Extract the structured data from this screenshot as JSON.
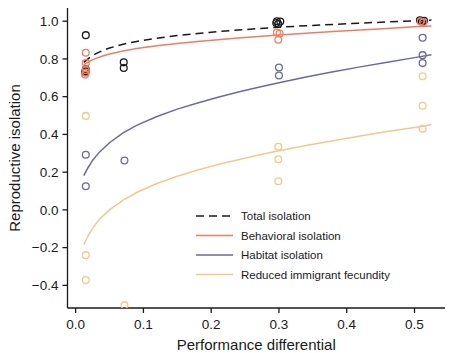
{
  "chart_data": {
    "type": "scatter",
    "title": "",
    "xlabel": "Performance differential",
    "ylabel": "Reproductive isolation",
    "xlim": [
      -0.012,
      0.545
    ],
    "ylim": [
      -0.52,
      1.07
    ],
    "xticks": [
      0.0,
      0.1,
      0.2,
      0.3,
      0.4,
      0.5
    ],
    "xticklabels": [
      "0.0",
      "0.1",
      "0.2",
      "0.3",
      "0.4",
      "0.5"
    ],
    "yticks": [
      1.0,
      0.8,
      0.6,
      0.4,
      0.2,
      0.0,
      -0.2,
      -0.4
    ],
    "yticklabels": [
      "1.0",
      "0.8",
      "0.6",
      "0.4",
      "0.2",
      "0.0",
      "−0.2",
      "−0.4"
    ],
    "grid": false,
    "legend_position": "lower right",
    "colors": {
      "total": "#1a1a1a",
      "behavioral": "#ef7d63",
      "habitat": "#6a6a9e",
      "fecundity": "#f3c98b"
    },
    "series": [
      {
        "name": "Total isolation",
        "key": "total",
        "color": "#1a1a1a",
        "linestyle": "dashed",
        "marker": "open-circle",
        "curve": [
          [
            0.012,
            0.782
          ],
          [
            0.02,
            0.806
          ],
          [
            0.03,
            0.828
          ],
          [
            0.04,
            0.845
          ],
          [
            0.05,
            0.858
          ],
          [
            0.07,
            0.878
          ],
          [
            0.09,
            0.893
          ],
          [
            0.12,
            0.91
          ],
          [
            0.15,
            0.924
          ],
          [
            0.18,
            0.935
          ],
          [
            0.21,
            0.945
          ],
          [
            0.24,
            0.953
          ],
          [
            0.27,
            0.961
          ],
          [
            0.3,
            0.968
          ],
          [
            0.34,
            0.976
          ],
          [
            0.38,
            0.983
          ],
          [
            0.42,
            0.99
          ],
          [
            0.46,
            0.996
          ],
          [
            0.5,
            1.002
          ],
          [
            0.525,
            1.006
          ]
        ],
        "points": [
          [
            0.015,
            0.926
          ],
          [
            0.015,
            0.745
          ],
          [
            0.015,
            0.735
          ],
          [
            0.014,
            0.73
          ],
          [
            0.071,
            0.782
          ],
          [
            0.071,
            0.752
          ],
          [
            0.297,
            1.0
          ],
          [
            0.302,
            0.998
          ],
          [
            0.299,
            0.985
          ],
          [
            0.296,
            0.99
          ],
          [
            0.508,
            1.005
          ],
          [
            0.514,
            1.002
          ],
          [
            0.511,
            0.998
          ]
        ]
      },
      {
        "name": "Behavioral isolation",
        "key": "behavioral",
        "color": "#ef7d63",
        "linestyle": "solid",
        "marker": "open-circle",
        "curve": [
          [
            0.012,
            0.768
          ],
          [
            0.02,
            0.787
          ],
          [
            0.03,
            0.803
          ],
          [
            0.04,
            0.816
          ],
          [
            0.05,
            0.826
          ],
          [
            0.07,
            0.842
          ],
          [
            0.09,
            0.855
          ],
          [
            0.12,
            0.87
          ],
          [
            0.15,
            0.882
          ],
          [
            0.18,
            0.893
          ],
          [
            0.21,
            0.902
          ],
          [
            0.24,
            0.911
          ],
          [
            0.27,
            0.919
          ],
          [
            0.3,
            0.927
          ],
          [
            0.34,
            0.936
          ],
          [
            0.38,
            0.945
          ],
          [
            0.42,
            0.954
          ],
          [
            0.46,
            0.962
          ],
          [
            0.5,
            0.97
          ],
          [
            0.525,
            0.975
          ]
        ],
        "points": [
          [
            0.015,
            0.833
          ],
          [
            0.015,
            0.778
          ],
          [
            0.015,
            0.742
          ],
          [
            0.015,
            0.728
          ],
          [
            0.014,
            0.718
          ],
          [
            0.297,
            0.94
          ],
          [
            0.301,
            0.935
          ],
          [
            0.299,
            0.902
          ],
          [
            0.509,
            0.998
          ],
          [
            0.513,
            0.995
          ]
        ]
      },
      {
        "name": "Habitat isolation",
        "key": "habitat",
        "color": "#6a6a9e",
        "linestyle": "solid",
        "marker": "open-circle",
        "curve": [
          [
            0.012,
            0.182
          ],
          [
            0.018,
            0.222
          ],
          [
            0.025,
            0.262
          ],
          [
            0.035,
            0.306
          ],
          [
            0.05,
            0.356
          ],
          [
            0.07,
            0.408
          ],
          [
            0.09,
            0.448
          ],
          [
            0.12,
            0.495
          ],
          [
            0.15,
            0.534
          ],
          [
            0.18,
            0.567
          ],
          [
            0.21,
            0.597
          ],
          [
            0.24,
            0.625
          ],
          [
            0.27,
            0.65
          ],
          [
            0.3,
            0.674
          ],
          [
            0.34,
            0.704
          ],
          [
            0.38,
            0.732
          ],
          [
            0.42,
            0.758
          ],
          [
            0.46,
            0.783
          ],
          [
            0.5,
            0.807
          ],
          [
            0.525,
            0.822
          ]
        ],
        "points": [
          [
            0.015,
            0.292
          ],
          [
            0.015,
            0.125
          ],
          [
            0.072,
            0.262
          ],
          [
            0.3,
            0.755
          ],
          [
            0.3,
            0.712
          ],
          [
            0.512,
            0.912
          ],
          [
            0.512,
            0.82
          ],
          [
            0.512,
            0.778
          ]
        ]
      },
      {
        "name": "Reduced immigrant fecundity",
        "key": "fecundity",
        "color": "#f3c98b",
        "linestyle": "solid",
        "marker": "open-circle",
        "curve": [
          [
            0.012,
            -0.185
          ],
          [
            0.018,
            -0.14
          ],
          [
            0.025,
            -0.098
          ],
          [
            0.035,
            -0.05
          ],
          [
            0.05,
            0.0
          ],
          [
            0.07,
            0.052
          ],
          [
            0.09,
            0.092
          ],
          [
            0.12,
            0.14
          ],
          [
            0.15,
            0.178
          ],
          [
            0.18,
            0.211
          ],
          [
            0.21,
            0.24
          ],
          [
            0.24,
            0.266
          ],
          [
            0.27,
            0.291
          ],
          [
            0.3,
            0.313
          ],
          [
            0.34,
            0.341
          ],
          [
            0.38,
            0.367
          ],
          [
            0.42,
            0.392
          ],
          [
            0.46,
            0.415
          ],
          [
            0.5,
            0.437
          ],
          [
            0.525,
            0.451
          ]
        ],
        "points": [
          [
            0.015,
            0.498
          ],
          [
            0.015,
            -0.24
          ],
          [
            0.015,
            -0.372
          ],
          [
            0.072,
            -0.505
          ],
          [
            0.299,
            0.335
          ],
          [
            0.299,
            0.268
          ],
          [
            0.299,
            0.152
          ],
          [
            0.512,
            0.708
          ],
          [
            0.512,
            0.552
          ],
          [
            0.512,
            0.43
          ]
        ]
      }
    ]
  },
  "legend": {
    "items": [
      {
        "label": "Total isolation",
        "color": "#1a1a1a",
        "style": "dashed"
      },
      {
        "label": "Behavioral isolation",
        "color": "#ef7d63",
        "style": "solid"
      },
      {
        "label": "Habitat isolation",
        "color": "#6a6a9e",
        "style": "solid"
      },
      {
        "label": "Reduced immigrant fecundity",
        "color": "#f3c98b",
        "style": "solid"
      }
    ]
  }
}
